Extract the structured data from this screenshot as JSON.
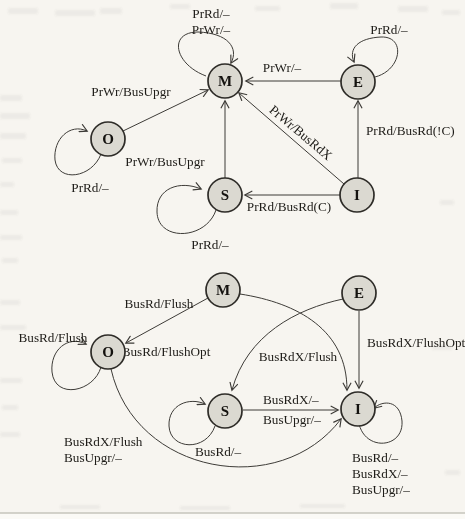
{
  "colors": {
    "state_fill": "#dbd9d1",
    "state_stroke": "#2e2c28",
    "edge": "#3d3b37",
    "text": "#1e1c18",
    "background": "#f7f5f0"
  },
  "top_diagram": {
    "states": {
      "m": "M",
      "e": "E",
      "o": "O",
      "s": "S",
      "i": "I"
    },
    "transitions": {
      "m_self_1": "PrRd/–",
      "m_self_2": "PrWr/–",
      "e_self": "PrRd/–",
      "e_to_m": "PrWr/–",
      "o_to_m": "PrWr/BusUpgr",
      "o_self": "PrRd/–",
      "s_to_m": "PrWr/BusUpgr",
      "s_self": "PrRd/–",
      "i_to_m": "PrWr/BusRdX",
      "i_to_e": "PrRd/BusRd(!C)",
      "i_to_s": "PrRd/BusRd(C)"
    }
  },
  "bottom_diagram": {
    "states": {
      "m": "M",
      "e": "E",
      "o": "O",
      "s": "S",
      "i": "I"
    },
    "transitions": {
      "m_to_o": "BusRd/Flush",
      "o_self": "BusRd/Flush",
      "e_to_s": "BusRd/FlushOpt",
      "m_to_i": "BusRdX/Flush",
      "e_to_i": "BusRdX/FlushOpt",
      "s_to_i_1": "BusRdX/–",
      "s_to_i_2": "BusUpgr/–",
      "s_self": "BusRd/–",
      "o_to_i_1": "BusRdX/Flush",
      "o_to_i_2": "BusUpgr/–",
      "i_self_1": "BusRd/–",
      "i_self_2": "BusRdX/–",
      "i_self_3": "BusUpgr/–"
    }
  }
}
